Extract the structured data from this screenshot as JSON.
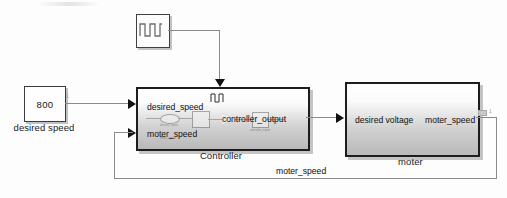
{
  "diagram": {
    "blocks": {
      "constant": {
        "value": "800",
        "label": "desired speed",
        "icon": "constant-block-icon"
      },
      "pulse": {
        "label": "",
        "icon": "pulse-generator-icon"
      },
      "controller": {
        "label": "Controller",
        "inputs": [
          "desired_speed",
          "moter_speed"
        ],
        "outputs": [
          "controller_output"
        ],
        "preview_labels": [
          "desired_speed",
          "moter_speed",
          "controller_output"
        ]
      },
      "moter": {
        "label": "moter",
        "inputs": [
          "desired voltage"
        ],
        "outputs": [
          "moter_speed"
        ]
      }
    },
    "signals": {
      "feedback_label": "moter_speed"
    },
    "colors": {
      "wire": "#8a8a8a",
      "block_border": "#1d1d1d",
      "block_fill_top": "#ffffff",
      "block_fill_bottom": "#b9b9b9",
      "text": "#101010"
    }
  }
}
